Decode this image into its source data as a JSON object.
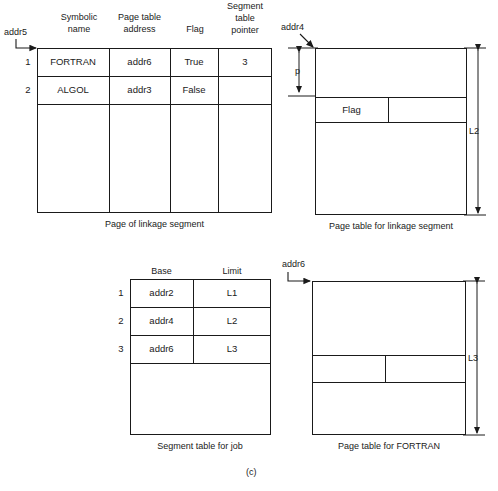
{
  "figure": {
    "label": "(c)"
  },
  "linkage_page": {
    "pointer_label": "addr5",
    "caption": "Page of linkage segment",
    "columns": [
      "Symbolic name",
      "Page table address",
      "Flag",
      "Segment table pointer"
    ],
    "column_lines": [
      [
        "Symbolic",
        "name"
      ],
      [
        "Page table",
        "address"
      ],
      [
        "Flag"
      ],
      [
        "Segment",
        "table",
        "pointer"
      ]
    ],
    "row_numbers": [
      "1",
      "2"
    ],
    "rows": [
      {
        "num": "1",
        "symbolic_name": "FORTRAN",
        "page_table_address": "addr6",
        "flag": "True",
        "segment_table_pointer": "3"
      },
      {
        "num": "2",
        "symbolic_name": "ALGOL",
        "page_table_address": "addr3",
        "flag": "False",
        "segment_table_pointer": ""
      }
    ]
  },
  "linkage_page_table": {
    "pointer_label": "addr4",
    "page_size_label": "p",
    "length_label": "L2",
    "flag_label": "Flag",
    "caption": "Page table for linkage segment"
  },
  "segment_table": {
    "caption": "Segment table for job",
    "columns": [
      "Base",
      "Limit"
    ],
    "rows": [
      {
        "num": "1",
        "base": "addr2",
        "limit": "L1"
      },
      {
        "num": "2",
        "base": "addr4",
        "limit": "L2"
      },
      {
        "num": "3",
        "base": "addr6",
        "limit": "L3"
      }
    ]
  },
  "fortran_page_table": {
    "pointer_label": "addr6",
    "length_label": "L3",
    "caption": "Page table for FORTRAN"
  }
}
